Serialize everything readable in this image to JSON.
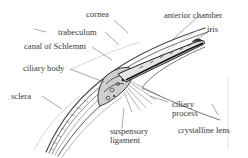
{
  "diagram": {
    "labels": [
      {
        "id": "cornea",
        "text": "cornea"
      },
      {
        "id": "trabeculum",
        "text": "trabeculum"
      },
      {
        "id": "canal-of-schlemm",
        "text": "canal of Schlemm"
      },
      {
        "id": "ciliary-body",
        "text": "ciliary body"
      },
      {
        "id": "sclera",
        "text": "sclera"
      },
      {
        "id": "anterior-chamber",
        "text": "anterior chamber"
      },
      {
        "id": "iris",
        "text": "iris"
      },
      {
        "id": "ciliary-process-1",
        "text": "ciliary"
      },
      {
        "id": "ciliary-process-2",
        "text": "process"
      },
      {
        "id": "suspensory-ligament-1",
        "text": "suspensory"
      },
      {
        "id": "suspensory-ligament-2",
        "text": "ligament"
      },
      {
        "id": "crystalline-lens",
        "text": "crystalline lens"
      }
    ]
  }
}
